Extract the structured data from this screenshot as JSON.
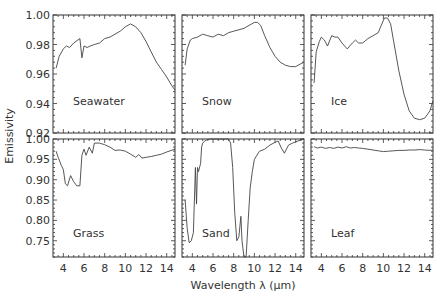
{
  "chart_data": {
    "type": "line",
    "title": "",
    "xlabel": "Wavelength λ (μm)",
    "ylabel": "Emissivity",
    "xlim": [
      3.0,
      14.8
    ],
    "xticks": [
      4,
      6,
      8,
      10,
      12,
      14
    ],
    "layout": {
      "rows": 2,
      "cols": 3
    },
    "rows": [
      {
        "ylim": [
          0.92,
          1.0
        ],
        "yticks": [
          0.92,
          0.94,
          0.96,
          0.98,
          1.0
        ],
        "ytick_labels": [
          "0.92",
          "0.94",
          "0.96",
          "0.98",
          "1.00"
        ]
      },
      {
        "ylim": [
          0.71,
          1.0
        ],
        "yticks": [
          0.75,
          0.8,
          0.85,
          0.9,
          0.95,
          1.0
        ],
        "ytick_labels": [
          "0.75",
          "0.80",
          "0.85",
          "0.90",
          "0.95",
          "1.00"
        ]
      }
    ],
    "panels": [
      {
        "name": "Seawater",
        "row": 0,
        "col": 0,
        "x": [
          3.3,
          3.6,
          4.0,
          4.3,
          4.6,
          5.0,
          5.4,
          5.6,
          5.8,
          6.0,
          6.3,
          6.6,
          7.0,
          7.5,
          8.0,
          8.5,
          9.0,
          9.5,
          10.0,
          10.5,
          11.0,
          11.5,
          12.0,
          12.5,
          13.0,
          13.5,
          14.0,
          14.5,
          14.8
        ],
        "y": [
          0.964,
          0.972,
          0.977,
          0.979,
          0.978,
          0.981,
          0.983,
          0.984,
          0.971,
          0.979,
          0.978,
          0.979,
          0.98,
          0.981,
          0.984,
          0.985,
          0.987,
          0.989,
          0.992,
          0.994,
          0.992,
          0.988,
          0.982,
          0.975,
          0.968,
          0.963,
          0.958,
          0.952,
          0.949
        ]
      },
      {
        "name": "Snow",
        "row": 0,
        "col": 1,
        "x": [
          3.3,
          3.5,
          3.8,
          4.0,
          4.5,
          5.0,
          5.5,
          6.0,
          6.5,
          7.0,
          7.5,
          8.0,
          8.5,
          9.0,
          9.5,
          10.0,
          10.3,
          10.6,
          11.0,
          11.5,
          12.0,
          12.5,
          13.0,
          13.5,
          14.0,
          14.5,
          14.8
        ],
        "y": [
          0.966,
          0.977,
          0.983,
          0.984,
          0.985,
          0.987,
          0.986,
          0.985,
          0.987,
          0.986,
          0.988,
          0.989,
          0.99,
          0.991,
          0.993,
          0.995,
          0.995,
          0.993,
          0.986,
          0.978,
          0.972,
          0.968,
          0.966,
          0.965,
          0.965,
          0.967,
          0.968
        ]
      },
      {
        "name": "Ice",
        "row": 0,
        "col": 2,
        "x": [
          3.3,
          3.5,
          3.8,
          4.0,
          4.3,
          4.6,
          5.0,
          5.3,
          5.6,
          6.0,
          6.5,
          7.0,
          7.3,
          7.6,
          8.0,
          8.5,
          9.0,
          9.5,
          9.8,
          10.1,
          10.4,
          10.7,
          11.0,
          11.5,
          12.0,
          12.5,
          13.0,
          13.5,
          14.0,
          14.5,
          14.8
        ],
        "y": [
          0.954,
          0.975,
          0.982,
          0.985,
          0.983,
          0.979,
          0.986,
          0.985,
          0.985,
          0.981,
          0.977,
          0.981,
          0.983,
          0.981,
          0.981,
          0.984,
          0.986,
          0.988,
          0.993,
          0.998,
          0.998,
          0.994,
          0.982,
          0.962,
          0.946,
          0.935,
          0.93,
          0.929,
          0.93,
          0.935,
          0.942
        ]
      },
      {
        "name": "Grass",
        "row": 1,
        "col": 0,
        "x": [
          3.3,
          3.5,
          3.8,
          4.0,
          4.2,
          4.4,
          4.7,
          5.0,
          5.3,
          5.6,
          5.8,
          6.0,
          6.2,
          6.5,
          6.8,
          7.0,
          7.5,
          8.0,
          8.5,
          9.0,
          9.5,
          10.0,
          10.5,
          11.0,
          11.3,
          11.6,
          12.0,
          12.5,
          13.0,
          13.5,
          14.0,
          14.8
        ],
        "y": [
          0.97,
          0.955,
          0.935,
          0.925,
          0.89,
          0.885,
          0.91,
          0.895,
          0.885,
          0.885,
          0.96,
          0.975,
          0.96,
          0.98,
          0.965,
          0.99,
          0.99,
          0.986,
          0.98,
          0.972,
          0.973,
          0.97,
          0.963,
          0.955,
          0.962,
          0.953,
          0.955,
          0.957,
          0.96,
          0.963,
          0.968,
          0.975
        ]
      },
      {
        "name": "Sand",
        "row": 1,
        "col": 1,
        "x": [
          3.3,
          3.5,
          3.7,
          3.9,
          4.1,
          4.3,
          4.4,
          4.5,
          4.6,
          4.8,
          4.9,
          5.0,
          5.2,
          5.4,
          5.7,
          6.0,
          6.5,
          7.0,
          7.5,
          7.7,
          7.9,
          8.1,
          8.3,
          8.5,
          8.7,
          8.8,
          9.0,
          9.2,
          9.4,
          9.6,
          9.8,
          10.0,
          10.5,
          11.0,
          11.5,
          12.0,
          12.3,
          12.6,
          12.9,
          13.3,
          13.7,
          14.2,
          14.8
        ],
        "y": [
          0.85,
          0.78,
          0.745,
          0.75,
          0.77,
          0.93,
          0.84,
          0.93,
          0.92,
          0.94,
          0.98,
          0.99,
          0.995,
          0.998,
          1.0,
          1.0,
          1.0,
          1.0,
          1.0,
          0.99,
          0.93,
          0.82,
          0.75,
          0.76,
          0.81,
          0.75,
          0.71,
          0.71,
          0.8,
          0.88,
          0.92,
          0.95,
          0.97,
          0.975,
          0.985,
          0.992,
          0.995,
          0.978,
          0.965,
          0.985,
          0.99,
          0.995,
          1.0
        ]
      },
      {
        "name": "Leaf",
        "row": 1,
        "col": 2,
        "x": [
          3.3,
          3.6,
          4.0,
          4.4,
          4.8,
          5.2,
          5.6,
          6.0,
          6.4,
          6.8,
          7.2,
          7.6,
          8.0,
          8.5,
          9.0,
          9.5,
          10.0,
          10.5,
          11.0,
          11.5,
          12.0,
          12.5,
          13.0,
          13.5,
          14.0,
          14.5,
          14.8
        ],
        "y": [
          0.981,
          0.978,
          0.98,
          0.977,
          0.979,
          0.977,
          0.98,
          0.978,
          0.981,
          0.978,
          0.979,
          0.978,
          0.977,
          0.975,
          0.973,
          0.971,
          0.969,
          0.97,
          0.971,
          0.972,
          0.972,
          0.973,
          0.973,
          0.974,
          0.973,
          0.972,
          0.973
        ]
      }
    ]
  }
}
